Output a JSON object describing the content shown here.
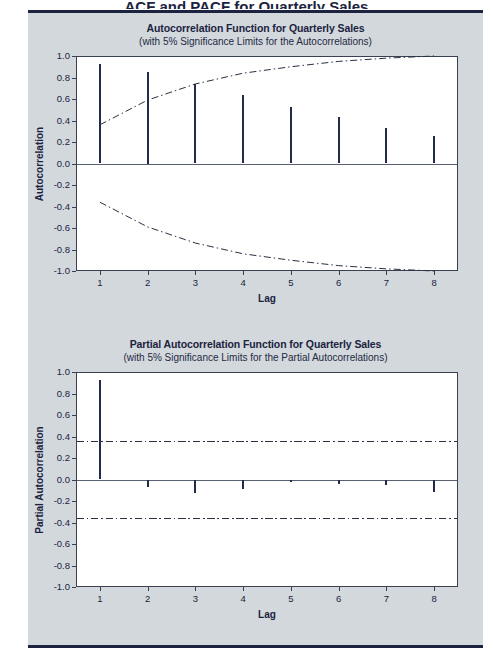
{
  "page": {
    "cut_header_text": "ACF and PACF for Quarterly Sales",
    "background": "#d3d8dd",
    "rule_color": "#1b2340"
  },
  "chart_data": [
    {
      "id": "acf",
      "type": "bar",
      "title": "Autocorrelation Function for Quarterly Sales",
      "subtitle": "(with 5% Significance Limits for the Autocorrelations)",
      "xlabel": "Lag",
      "ylabel": "Autocorrelation",
      "categories": [
        "1",
        "2",
        "3",
        "4",
        "5",
        "6",
        "7",
        "8"
      ],
      "x": [
        1,
        2,
        3,
        4,
        5,
        6,
        7,
        8
      ],
      "values": [
        0.93,
        0.85,
        0.74,
        0.64,
        0.53,
        0.43,
        0.33,
        0.26
      ],
      "ylim": [
        -1.0,
        1.0
      ],
      "xlim": [
        0.5,
        8.5
      ],
      "yticks": [
        "1.0",
        "0.8",
        "0.6",
        "0.4",
        "0.2",
        "0.0",
        "-0.2",
        "-0.4",
        "-0.6",
        "-0.8",
        "-1.0"
      ],
      "ytickvals": [
        1.0,
        0.8,
        0.6,
        0.4,
        0.2,
        0.0,
        -0.2,
        -0.4,
        -0.6,
        -0.8,
        -1.0
      ],
      "xticks": [
        "1",
        "2",
        "3",
        "4",
        "5",
        "6",
        "7",
        "8"
      ],
      "grid": false,
      "legend": "none",
      "significance_upper": [
        0.36,
        0.59,
        0.74,
        0.84,
        0.9,
        0.95,
        0.98,
        1.0
      ],
      "significance_lower": [
        -0.36,
        -0.59,
        -0.74,
        -0.84,
        -0.9,
        -0.95,
        -0.98,
        -1.0
      ],
      "significance_style": "dash-dot curve"
    },
    {
      "id": "pacf",
      "type": "bar",
      "title": "Partial Autocorrelation Function for Quarterly Sales",
      "subtitle": "(with 5% Significance Limits for the Partial Autocorrelations)",
      "xlabel": "Lag",
      "ylabel": "Partial Autocorrelation",
      "categories": [
        "1",
        "2",
        "3",
        "4",
        "5",
        "6",
        "7",
        "8"
      ],
      "x": [
        1,
        2,
        3,
        4,
        5,
        6,
        7,
        8
      ],
      "values": [
        0.93,
        -0.07,
        -0.13,
        -0.09,
        -0.02,
        -0.04,
        -0.05,
        -0.12
      ],
      "ylim": [
        -1.0,
        1.0
      ],
      "xlim": [
        0.5,
        8.5
      ],
      "yticks": [
        "1.0",
        "0.8",
        "0.6",
        "0.4",
        "0.2",
        "0.0",
        "-0.2",
        "-0.4",
        "-0.6",
        "-0.8",
        "-1.0"
      ],
      "ytickvals": [
        1.0,
        0.8,
        0.6,
        0.4,
        0.2,
        0.0,
        -0.2,
        -0.4,
        -0.6,
        -0.8,
        -1.0
      ],
      "xticks": [
        "1",
        "2",
        "3",
        "4",
        "5",
        "6",
        "7",
        "8"
      ],
      "grid": false,
      "legend": "none",
      "significance_upper": 0.36,
      "significance_lower": -0.36,
      "significance_style": "dash-dot straight line"
    }
  ]
}
